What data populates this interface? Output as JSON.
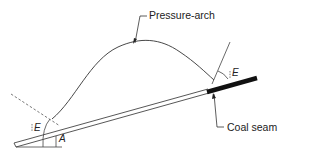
{
  "diagram": {
    "labels": {
      "pressure_arch": "Pressure-arch",
      "coal_seam": "Coal seam",
      "angle_e_left": "E",
      "angle_e_right": "E",
      "angle_a": "A"
    },
    "colors": {
      "line": "#333333",
      "seam_fill": "#111111",
      "background": "#ffffff"
    }
  }
}
